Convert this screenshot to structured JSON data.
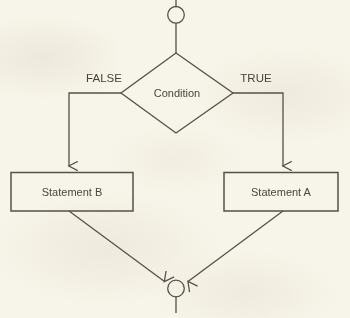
{
  "diagram": {
    "type": "flowchart",
    "background_color": "#f7f4e9",
    "stroke_color": "#55514a",
    "text_color": "#47433a",
    "nodes": {
      "start_connector": {
        "shape": "circle",
        "label": ""
      },
      "decision": {
        "shape": "diamond",
        "label": "Condition"
      },
      "statement_b": {
        "shape": "rectangle",
        "label": "Statement B"
      },
      "statement_a": {
        "shape": "rectangle",
        "label": "Statement A"
      },
      "end_connector": {
        "shape": "circle",
        "label": ""
      }
    },
    "edges": {
      "false_label": "FALSE",
      "true_label": "TRUE"
    }
  }
}
